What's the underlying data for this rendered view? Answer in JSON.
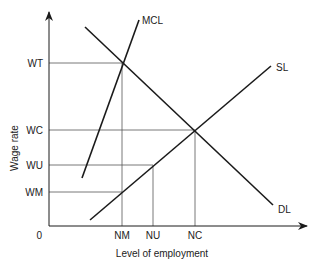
{
  "diagram": {
    "type": "labour market monopsony/union diagram",
    "y_axis_label": "Wage rate",
    "x_axis_label": "Level of employment",
    "origin_label": "0",
    "y_ticks": [
      {
        "label": "WT",
        "y": 63
      },
      {
        "label": "WC",
        "y": 130
      },
      {
        "label": "WU",
        "y": 165
      },
      {
        "label": "WM",
        "y": 192
      }
    ],
    "x_ticks": [
      {
        "label": "NM",
        "x": 122
      },
      {
        "label": "NU",
        "x": 153
      },
      {
        "label": "NC",
        "x": 195
      }
    ],
    "curves": [
      {
        "label": "MCL",
        "from": [
          82,
          178
        ],
        "to": [
          139,
          20
        ]
      },
      {
        "label": "SL",
        "from": [
          90,
          220
        ],
        "to": [
          271,
          66
        ]
      },
      {
        "label": "DL",
        "from": [
          85,
          27
        ],
        "to": [
          273,
          205
        ]
      }
    ],
    "colors": {
      "line": "#1a1a1a",
      "guide": "#555555",
      "text": "#222222"
    }
  }
}
